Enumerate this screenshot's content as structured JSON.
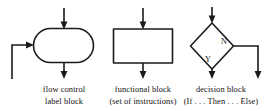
{
  "figure": {
    "background_color": "#ffffff",
    "line_color": "#1a1a1a",
    "text_color": "#111111"
  },
  "blocks": [
    {
      "id": "flow-control-block",
      "shape": "stadium",
      "caption_line1": "flow control",
      "caption_line2": "label block",
      "inputs": [
        "top-arrow",
        "left-loop-arrow"
      ],
      "outputs": [
        "bottom-arrow"
      ]
    },
    {
      "id": "functional-block",
      "shape": "rectangle",
      "caption_line1": "functional block",
      "caption_line2": "(set of instructions)",
      "inputs": [
        "top-arrow"
      ],
      "outputs": [
        "bottom-arrow"
      ]
    },
    {
      "id": "decision-block",
      "shape": "diamond",
      "caption_line1": "decision block",
      "caption_line2": "(If . . . Then . . . Else)",
      "branch_yes_label": "Y",
      "branch_no_label": "N",
      "inputs": [
        "top-arrow"
      ],
      "outputs": [
        "yes-bottom-arrow",
        "no-right-arrow"
      ]
    }
  ]
}
